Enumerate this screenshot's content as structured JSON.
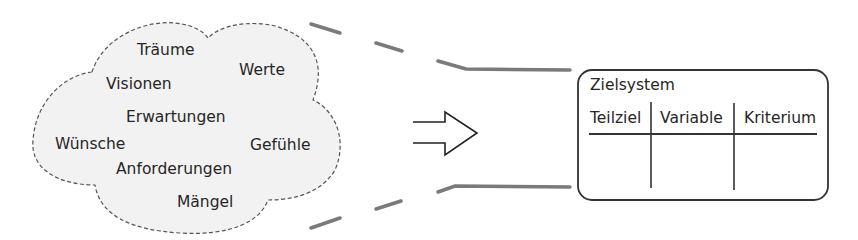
{
  "cloud": {
    "words": [
      {
        "label": "Träume",
        "x": 137,
        "y": 43
      },
      {
        "label": "Werte",
        "x": 239,
        "y": 63
      },
      {
        "label": "Visionen",
        "x": 106,
        "y": 77
      },
      {
        "label": "Erwartungen",
        "x": 126,
        "y": 110
      },
      {
        "label": "Wünsche",
        "x": 55,
        "y": 137
      },
      {
        "label": "Gefühle",
        "x": 250,
        "y": 138
      },
      {
        "label": "Anforderungen",
        "x": 116,
        "y": 162
      },
      {
        "label": "Mängel",
        "x": 177,
        "y": 195
      }
    ],
    "fill": "#f2f2f2",
    "stroke": "#555555"
  },
  "arrow": {
    "icon": "double-line-right-arrow-icon"
  },
  "zielsystem": {
    "title": "Zielsystem",
    "columns": [
      "Teilziel",
      "Variable",
      "Kriterium"
    ]
  },
  "colors": {
    "text": "#262626",
    "connector": "#7a7a7a",
    "box_border": "#333333"
  }
}
